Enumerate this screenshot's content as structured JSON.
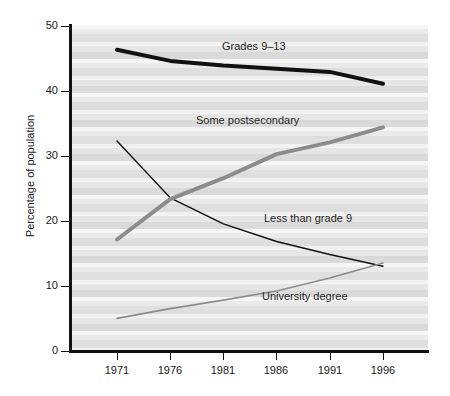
{
  "chart_data": {
    "type": "line",
    "title": "",
    "xlabel": "",
    "ylabel": "Percentage of population",
    "x": [
      1971,
      1976,
      1981,
      1986,
      1991,
      1996
    ],
    "categories": [
      "1971",
      "1976",
      "1981",
      "1986",
      "1991",
      "1996"
    ],
    "xlim": [
      1971,
      1996
    ],
    "ylim": [
      0,
      50
    ],
    "yticks": [
      0,
      10,
      20,
      30,
      40,
      50
    ],
    "ytick_labels": [
      "0",
      "10",
      "20",
      "30",
      "40",
      "50"
    ],
    "xticks": [
      1971,
      1976,
      1981,
      1986,
      1991,
      1996
    ],
    "xtick_labels": [
      "1971",
      "1976",
      "1981",
      "1986",
      "1991",
      "1996"
    ],
    "grid": false,
    "legend_position": "inline-annotations",
    "series": [
      {
        "name": "Grades 9-13",
        "label": "Grades 9–13",
        "color": "#111111",
        "width": 4,
        "values": [
          46.2,
          44.5,
          43.8,
          43.3,
          42.8,
          41.0
        ]
      },
      {
        "name": "Some postsecondary",
        "label": "Some postsecondary",
        "color": "#8c8c8c",
        "width": 4,
        "values": [
          17.1,
          23.3,
          26.5,
          30.2,
          32.0,
          34.3
        ]
      },
      {
        "name": "Less than grade 9",
        "label": "Less than grade 9",
        "color": "#111111",
        "width": 1.4,
        "values": [
          32.2,
          23.5,
          19.5,
          16.8,
          14.8,
          13.0
        ]
      },
      {
        "name": "University degree",
        "label": "University degree",
        "color": "#8c8c8c",
        "width": 1.6,
        "values": [
          5.0,
          6.5,
          7.8,
          9.2,
          11.2,
          13.5
        ]
      }
    ],
    "annotations": [
      {
        "text": "Grades 9–13",
        "x": 222,
        "y": 46
      },
      {
        "text": "Some postsecondary",
        "x": 196,
        "y": 120
      },
      {
        "text": "Less than grade 9",
        "x": 264,
        "y": 218
      },
      {
        "text": "University degree",
        "x": 262,
        "y": 296
      }
    ]
  },
  "axis": {
    "ylabel": "Percentage of population"
  }
}
